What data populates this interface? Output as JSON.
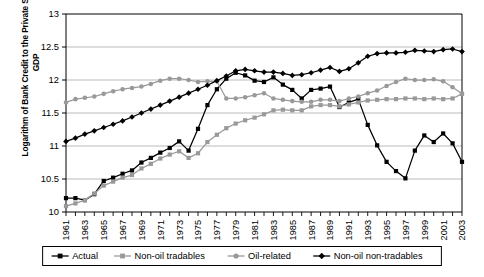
{
  "chart_data": {
    "type": "line",
    "title": "",
    "xlabel": "",
    "ylabel": "Logarithm of Bank Credit to the Private Sector to GDP",
    "ylim": [
      10,
      13
    ],
    "yticks": [
      10,
      10.5,
      11,
      11.5,
      12,
      12.5,
      13
    ],
    "ytick_labels": [
      "10",
      "10.5",
      "11",
      "11.5",
      "12",
      "12.5",
      "13"
    ],
    "grid": true,
    "legend_position": "bottom",
    "x": [
      1961,
      1962,
      1963,
      1964,
      1965,
      1966,
      1967,
      1968,
      1969,
      1970,
      1971,
      1972,
      1973,
      1974,
      1975,
      1976,
      1977,
      1978,
      1979,
      1980,
      1981,
      1982,
      1983,
      1984,
      1985,
      1986,
      1987,
      1988,
      1989,
      1990,
      1991,
      1992,
      1993,
      1994,
      1995,
      1996,
      1997,
      1998,
      1999,
      2000,
      2001,
      2002,
      2003
    ],
    "xtick_labels": [
      "1961",
      "1963",
      "1965",
      "1967",
      "1969",
      "1971",
      "1973",
      "1975",
      "1977",
      "1979",
      "1981",
      "1983",
      "1985",
      "1987",
      "1989",
      "1991",
      "1993",
      "1995",
      "1997",
      "1999",
      "2001",
      "2003"
    ],
    "series": [
      {
        "name": "Actual",
        "color": "#000000",
        "marker": "square",
        "values": [
          10.21,
          10.21,
          10.18,
          10.27,
          10.47,
          10.52,
          10.58,
          10.63,
          10.75,
          10.82,
          10.9,
          10.97,
          11.07,
          10.93,
          11.26,
          11.62,
          11.86,
          12.02,
          12.11,
          12.07,
          11.99,
          11.97,
          12.04,
          11.93,
          11.85,
          11.72,
          11.85,
          11.87,
          11.9,
          11.59,
          11.66,
          11.71,
          11.32,
          11.01,
          10.76,
          10.62,
          10.51,
          10.93,
          11.16,
          11.06,
          11.19,
          11.04,
          10.76
        ]
      },
      {
        "name": "Non-oil tradables",
        "color": "#999999",
        "marker": "square",
        "values": [
          10.09,
          10.13,
          10.18,
          10.28,
          10.4,
          10.46,
          10.52,
          10.56,
          10.66,
          10.73,
          10.81,
          10.87,
          10.92,
          10.82,
          10.89,
          11.06,
          11.17,
          11.27,
          11.34,
          11.39,
          11.43,
          11.48,
          11.54,
          11.55,
          11.54,
          11.54,
          11.6,
          11.62,
          11.62,
          11.6,
          11.63,
          11.66,
          11.69,
          11.7,
          11.71,
          11.71,
          11.72,
          11.72,
          11.71,
          11.72,
          11.71,
          11.72,
          11.79
        ]
      },
      {
        "name": "Oil-related",
        "color": "#999999",
        "marker": "circle",
        "values": [
          11.66,
          11.71,
          11.73,
          11.75,
          11.79,
          11.83,
          11.86,
          11.88,
          11.9,
          11.94,
          11.99,
          12.02,
          12.02,
          12.0,
          11.97,
          11.98,
          11.98,
          11.72,
          11.72,
          11.74,
          11.77,
          11.8,
          11.72,
          11.7,
          11.68,
          11.67,
          11.67,
          11.7,
          11.7,
          11.68,
          11.72,
          11.75,
          11.8,
          11.84,
          11.91,
          11.97,
          12.02,
          12.0,
          12.0,
          12.01,
          11.98,
          11.89,
          11.79
        ]
      },
      {
        "name": "Non-oil non-tradables",
        "color": "#000000",
        "marker": "diamond",
        "values": [
          11.07,
          11.12,
          11.18,
          11.23,
          11.28,
          11.33,
          11.38,
          11.44,
          11.5,
          11.56,
          11.62,
          11.68,
          11.74,
          11.8,
          11.86,
          11.92,
          11.99,
          12.06,
          12.14,
          12.16,
          12.14,
          12.12,
          12.12,
          12.1,
          12.07,
          12.08,
          12.11,
          12.15,
          12.19,
          12.13,
          12.17,
          12.26,
          12.36,
          12.4,
          12.41,
          12.41,
          12.42,
          12.45,
          12.44,
          12.43,
          12.46,
          12.47,
          12.43
        ]
      }
    ]
  },
  "legend": {
    "entries": [
      {
        "label": "Actual",
        "color": "#000000",
        "marker": "square"
      },
      {
        "label": "Non-oil tradables",
        "color": "#999999",
        "marker": "square"
      },
      {
        "label": "Oil-related",
        "color": "#999999",
        "marker": "circle"
      },
      {
        "label": "Non-oil non-tradables",
        "color": "#000000",
        "marker": "diamond"
      }
    ]
  }
}
